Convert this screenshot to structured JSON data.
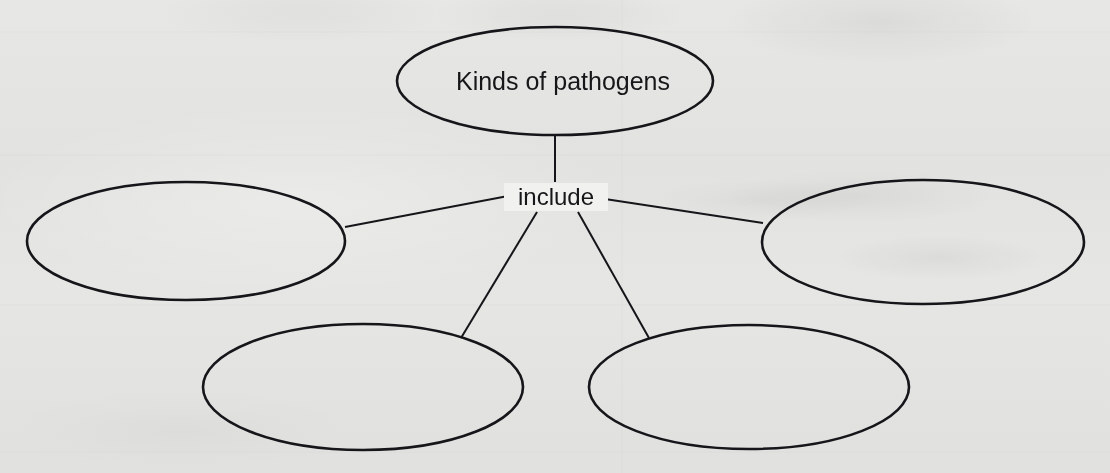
{
  "page": {
    "kind": "concept-map-worksheet",
    "width": 1110,
    "height": 473,
    "background_color": "#f2f2f1",
    "ink_color": "#16161a"
  },
  "diagram": {
    "type": "concept-map",
    "title_node_text": "Kinds of pathogens",
    "edge_label_text": "include",
    "nodes": [
      {
        "id": "root",
        "label": "Kinds of pathogens",
        "filled": true,
        "cx": 555,
        "cy": 81,
        "rx": 158,
        "ry": 54,
        "stroke_width": 2.6,
        "font_size": 25
      },
      {
        "id": "branch-left",
        "label": "",
        "filled": false,
        "cx": 186,
        "cy": 241,
        "rx": 159,
        "ry": 59,
        "stroke_width": 2.6,
        "font_size": 25
      },
      {
        "id": "branch-right",
        "label": "",
        "filled": false,
        "cx": 923,
        "cy": 242,
        "rx": 161,
        "ry": 62,
        "stroke_width": 2.6,
        "font_size": 25
      },
      {
        "id": "branch-bottom-left",
        "label": "",
        "filled": false,
        "cx": 363,
        "cy": 387,
        "rx": 160,
        "ry": 63,
        "stroke_width": 2.6,
        "font_size": 25
      },
      {
        "id": "branch-bottom-right",
        "label": "",
        "filled": false,
        "cx": 749,
        "cy": 387,
        "rx": 160,
        "ry": 62,
        "stroke_width": 2.6,
        "font_size": 25
      }
    ],
    "edge_label": {
      "text": "include",
      "x": 556,
      "y": 204,
      "font_size": 24,
      "anchor": "middle"
    },
    "edges": [
      {
        "id": "edge-root-to-hub",
        "from": "root",
        "to": "hub",
        "x1": 555,
        "y1": 136,
        "x2": 555,
        "y2": 182,
        "stroke_width": 2.0
      },
      {
        "id": "edge-hub-to-left",
        "from": "hub",
        "to": "branch-left",
        "x1": 508,
        "y1": 196,
        "x2": 345,
        "y2": 227,
        "stroke_width": 2.0
      },
      {
        "id": "edge-hub-to-right",
        "from": "hub",
        "to": "branch-right",
        "x1": 605,
        "y1": 199,
        "x2": 763,
        "y2": 223,
        "stroke_width": 2.0
      },
      {
        "id": "edge-hub-to-bottom-left",
        "from": "hub",
        "to": "branch-bottom-left",
        "x1": 537,
        "y1": 212,
        "x2": 461,
        "y2": 338,
        "stroke_width": 2.0
      },
      {
        "id": "edge-hub-to-bottom-right",
        "from": "hub",
        "to": "branch-bottom-right",
        "x1": 578,
        "y1": 212,
        "x2": 649,
        "y2": 338,
        "stroke_width": 2.0
      }
    ],
    "blank_node_count": 4,
    "instruction_note": ""
  }
}
